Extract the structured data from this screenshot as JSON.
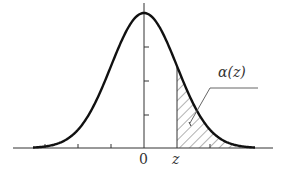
{
  "diagram": {
    "type": "standard normal density curve with shaded upper tail",
    "labels": {
      "origin": "0",
      "z": "z",
      "tail_area": "α(z)"
    },
    "colors": {
      "curve": "#111111",
      "axes": "#333333",
      "hatch": "#555555",
      "background": "#ffffff"
    }
  }
}
